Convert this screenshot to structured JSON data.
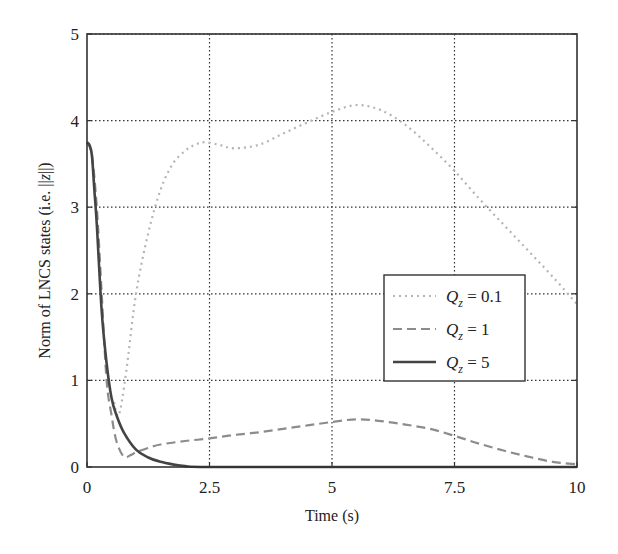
{
  "chart_data": {
    "type": "line",
    "title": "",
    "xlabel": "Time (s)",
    "ylabel": "Norm of LNCS states (i.e. ||z||)",
    "xlim": [
      0,
      10
    ],
    "ylim": [
      0,
      5
    ],
    "xticks": [
      0,
      2.5,
      5,
      7.5,
      10
    ],
    "xtick_labels": [
      "0",
      "2.5",
      "5",
      "7.5",
      "10"
    ],
    "yticks": [
      0,
      1,
      2,
      3,
      4,
      5
    ],
    "ytick_labels": [
      "0",
      "1",
      "2",
      "3",
      "4",
      "5"
    ],
    "grid": true,
    "grid_style": "dotted",
    "legend_position": "center-right",
    "series": [
      {
        "name": "Q_z = 0.1",
        "legend_var": "Q",
        "legend_sub": "z",
        "legend_value": " = 0.1",
        "style": "dotted",
        "color": "#b5b5b5",
        "x": [
          0.55,
          0.65,
          0.8,
          1.0,
          1.25,
          1.5,
          1.75,
          2.0,
          2.2,
          2.4,
          2.7,
          3.0,
          3.5,
          4.0,
          4.5,
          5.0,
          5.5,
          6.0,
          6.5,
          7.0,
          7.5,
          8.0,
          8.5,
          9.0,
          9.5,
          10.0
        ],
        "values": [
          0.75,
          0.6,
          1.1,
          2.0,
          2.7,
          3.2,
          3.5,
          3.65,
          3.72,
          3.75,
          3.72,
          3.68,
          3.72,
          3.85,
          3.98,
          4.1,
          4.18,
          4.12,
          3.95,
          3.7,
          3.42,
          3.1,
          2.8,
          2.5,
          2.2,
          1.88
        ]
      },
      {
        "name": "Q_z = 1",
        "legend_var": "Q",
        "legend_sub": "z",
        "legend_value": " = 1",
        "style": "dashed",
        "color": "#8c8c8c",
        "x": [
          0.0,
          0.1,
          0.2,
          0.3,
          0.4,
          0.5,
          0.6,
          0.75,
          0.9,
          1.0,
          1.25,
          1.5,
          2.0,
          2.5,
          3.0,
          3.5,
          4.0,
          4.5,
          5.0,
          5.5,
          6.0,
          6.5,
          7.0,
          7.5,
          8.0,
          8.5,
          9.0,
          9.5,
          10.0
        ],
        "values": [
          3.75,
          3.6,
          3.0,
          2.0,
          1.0,
          0.6,
          0.3,
          0.12,
          0.14,
          0.17,
          0.22,
          0.26,
          0.3,
          0.33,
          0.37,
          0.4,
          0.44,
          0.48,
          0.52,
          0.55,
          0.53,
          0.49,
          0.44,
          0.36,
          0.27,
          0.19,
          0.12,
          0.06,
          0.03
        ]
      },
      {
        "name": "Q_z = 5",
        "legend_var": "Q",
        "legend_sub": "z",
        "legend_value": " = 5",
        "style": "solid",
        "color": "#444444",
        "x": [
          0.0,
          0.05,
          0.1,
          0.15,
          0.2,
          0.3,
          0.4,
          0.5,
          0.6,
          0.75,
          1.0,
          1.25,
          1.5,
          1.75,
          2.0,
          2.5,
          5.0,
          7.5,
          10.0
        ],
        "values": [
          3.75,
          3.72,
          3.6,
          3.2,
          2.8,
          1.8,
          1.2,
          0.8,
          0.6,
          0.4,
          0.2,
          0.11,
          0.06,
          0.03,
          0.01,
          0.0,
          0.0,
          0.0,
          0.0
        ]
      }
    ]
  }
}
